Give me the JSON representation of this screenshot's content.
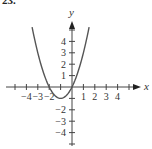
{
  "problem_label": "23.",
  "chart_data": {
    "type": "line",
    "title": "",
    "xlabel": "x",
    "ylabel": "y",
    "function": "y = x^2 + 2x",
    "x_ticks": [
      -4,
      -3,
      -2,
      1,
      2,
      3,
      4
    ],
    "y_ticks": [
      -4,
      -3,
      -2,
      1,
      2,
      3,
      4
    ],
    "xlim": [
      -5,
      6
    ],
    "ylim": [
      -5,
      6
    ],
    "grid": false,
    "series": [
      {
        "name": "parabola",
        "x": [
          -3.5,
          -3,
          -2.5,
          -2,
          -1.5,
          -1,
          -0.5,
          0,
          0.5,
          1,
          1.5
        ],
        "y": [
          5.25,
          3,
          1.25,
          0,
          -0.75,
          -1,
          -0.75,
          0,
          1.25,
          3,
          5.25
        ]
      }
    ],
    "key_points": {
      "x_intercepts": [
        -2,
        0
      ],
      "vertex": [
        -1,
        -1
      ]
    },
    "color": "#444444"
  }
}
